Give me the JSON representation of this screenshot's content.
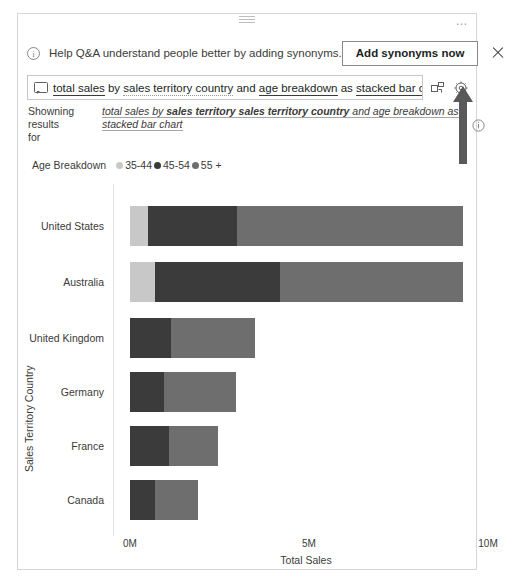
{
  "top_sliver": {
    "ghost_text": "·   ·                                                                      ·"
  },
  "card": {
    "drag_handle_name": "drag-handle",
    "more_options": "…"
  },
  "banner": {
    "info_icon": "i",
    "message": "Help Q&A understand people better by adding synonyms.",
    "action_label": "Add synonyms now",
    "close_label": "×"
  },
  "query": {
    "icon": "speech-bubble-icon",
    "segments": [
      {
        "text": "total sales",
        "style": "solid"
      },
      {
        "text": " by ",
        "style": "plain"
      },
      {
        "text": "sales territory country",
        "style": "dotted"
      },
      {
        "text": " and ",
        "style": "plain"
      },
      {
        "text": "age breakdown",
        "style": "solid"
      },
      {
        "text": " as ",
        "style": "plain"
      },
      {
        "text": "stacked bar chart",
        "style": "solid"
      }
    ],
    "full_text": "total sales by sales territory country and age breakdown as stacked bar chart",
    "tools": [
      {
        "name": "pin-visual-icon",
        "title": "Turn into visual"
      },
      {
        "name": "gear-icon",
        "title": "Settings"
      }
    ]
  },
  "showing_results": {
    "label": "Showning results for",
    "parts": [
      {
        "text": "total sales by ",
        "bold": false
      },
      {
        "text": "sales territory sales territory country",
        "bold": true
      },
      {
        "text": " and age breakdown as stacked bar chart",
        "bold": false
      }
    ]
  },
  "annotation": {
    "arrow_name": "up-arrow-annotation",
    "arrow_color": "#595959",
    "info_icon": "i"
  },
  "chart_data": {
    "type": "bar",
    "orientation": "horizontal",
    "stacked": true,
    "title": "",
    "xlabel": "Total Sales",
    "ylabel": "Sales Territory Country",
    "xlim": [
      0,
      10000000
    ],
    "xticks": [
      0,
      5000000,
      10000000
    ],
    "xticklabels": [
      "0M",
      "5M",
      "10M"
    ],
    "grid": false,
    "legend_title": "Age Breakdown",
    "legend_position": "top-left",
    "categories": [
      "United States",
      "Australia",
      "United Kingdom",
      "Germany",
      "France",
      "Canada"
    ],
    "series": [
      {
        "name": "35-44",
        "color": "#c8c8c8",
        "values": [
          500000,
          700000,
          0,
          0,
          0,
          0
        ]
      },
      {
        "name": "45-54",
        "color": "#3b3b3b",
        "values": [
          2500000,
          3500000,
          1150000,
          950000,
          1100000,
          700000
        ]
      },
      {
        "name": "55 +",
        "color": "#6e6e6e",
        "values": [
          6300000,
          5100000,
          2350000,
          2000000,
          1350000,
          1200000
        ]
      }
    ]
  }
}
